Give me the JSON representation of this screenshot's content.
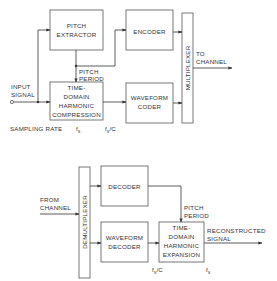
{
  "encoder_diagram": {
    "blocks": {
      "pitch_extractor": [
        "PITCH",
        "EXTRACTOR"
      ],
      "encoder": [
        "ENCODER"
      ],
      "tdhc": [
        "TIME-",
        "DOMAIN",
        "HARMONIC",
        "COMPRESSION"
      ],
      "waveform_coder": [
        "WAVEFORM",
        "CODER"
      ],
      "multiplexer": "MULTIPLEXER"
    },
    "labels": {
      "input_signal": [
        "INPUT",
        "SIGNAL"
      ],
      "pitch_period": [
        "PITCH",
        "PERIOD"
      ],
      "to_channel": [
        "TO",
        "CHANNEL"
      ],
      "sampling_rate": "SAMPLING RATE",
      "fs": "f",
      "fs_sub": "s",
      "fs_over_c": "f",
      "fs_over_c_sub": "s",
      "fs_over_c_tail": "/C"
    }
  },
  "decoder_diagram": {
    "blocks": {
      "demultiplexer": "DEMULTIPLEXER",
      "decoder": [
        "DECODER"
      ],
      "waveform_decoder": [
        "WAVEFORM",
        "DECODER"
      ],
      "tdhe": [
        "TIME-",
        "DOMAIN",
        "HARMONIC",
        "EXPANSION"
      ]
    },
    "labels": {
      "from_channel": [
        "FROM",
        "CHANNEL"
      ],
      "pitch_period": [
        "PITCH",
        "PERIOD"
      ],
      "reconstructed_signal": [
        "RECONSTRUCTED",
        "SIGNAL"
      ],
      "fs_over_c": "f",
      "fs_over_c_sub": "s",
      "fs_over_c_tail": "/C",
      "fs": "f",
      "fs_sub": "s"
    }
  }
}
